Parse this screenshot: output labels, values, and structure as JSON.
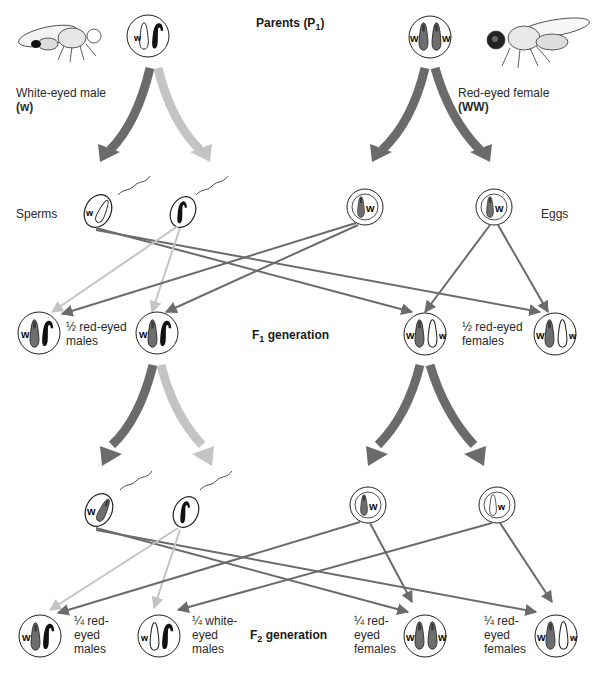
{
  "colors": {
    "red_allele": "#6e6e6e",
    "white_allele": "#ffffff",
    "y_chromosome": "#111111",
    "dark_arrow": "#6b6b6b",
    "light_arrow": "#c4c4c4",
    "outline": "#222222"
  },
  "parents": {
    "heading": "Parents",
    "heading_sub": "(P",
    "heading_sub_index": "1",
    "heading_close": ")",
    "male": {
      "label": "White-eyed male",
      "genotype": "(w)",
      "allele": "w"
    },
    "female": {
      "label": "Red-eyed female",
      "genotype": "(WW)",
      "alleles": [
        "W",
        "W"
      ]
    }
  },
  "gametes": {
    "sperms_label": "Sperms",
    "eggs_label": "Eggs",
    "p1_sperms": [
      {
        "allele": "w",
        "chromosome": "X-white"
      },
      {
        "allele": "",
        "chromosome": "Y"
      }
    ],
    "p1_eggs": [
      {
        "allele": "W"
      },
      {
        "allele": "W"
      }
    ],
    "f1_sperms": [
      {
        "allele": "W",
        "chromosome": "X-red"
      },
      {
        "allele": "",
        "chromosome": "Y"
      }
    ],
    "f1_eggs": [
      {
        "allele": "W",
        "color": "red"
      },
      {
        "allele": "w",
        "color": "white"
      }
    ]
  },
  "f1": {
    "heading": "F",
    "heading_index": "1",
    "heading_rest": " generation",
    "males_label": "½ red-eyed\nmales",
    "females_label": "½ red-eyed\nfemales",
    "offspring": [
      {
        "sex": "male",
        "alleles": [
          "W"
        ]
      },
      {
        "sex": "male",
        "alleles": [
          "W"
        ]
      },
      {
        "sex": "female",
        "alleles": [
          "W",
          "w"
        ]
      },
      {
        "sex": "female",
        "alleles": [
          "W",
          "w"
        ]
      }
    ]
  },
  "f2": {
    "heading": "F",
    "heading_index": "2",
    "heading_rest": " generation",
    "offspring": [
      {
        "sex": "male",
        "alleles": [
          "W"
        ],
        "label": "¼ red-\neyed\nmales"
      },
      {
        "sex": "male",
        "alleles": [
          "w"
        ],
        "label": "¼ white-\neyed\nmales"
      },
      {
        "sex": "female",
        "alleles": [
          "W",
          "W"
        ],
        "label": "¼ red-\neyed\nfemales"
      },
      {
        "sex": "female",
        "alleles": [
          "W",
          "w"
        ],
        "label": "¼ red-\neyed\nfemales"
      }
    ]
  }
}
